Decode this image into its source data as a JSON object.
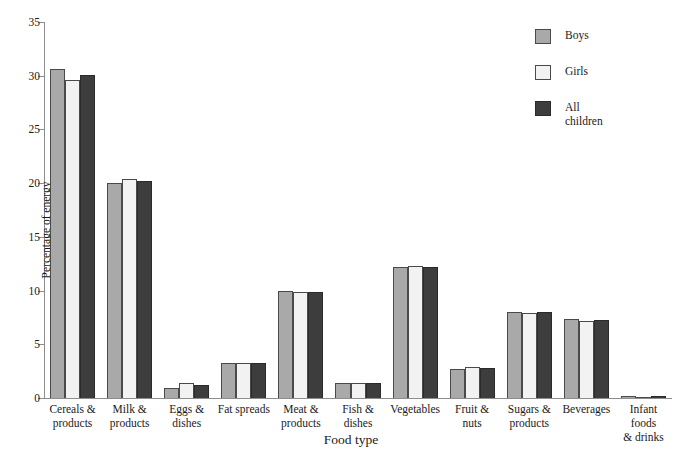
{
  "chart_data": {
    "type": "bar",
    "title": "",
    "xlabel": "Food type",
    "ylabel": "Percentage of energy",
    "ylim": [
      0,
      35
    ],
    "yticks": [
      0,
      5,
      10,
      15,
      20,
      25,
      30,
      35
    ],
    "grid": false,
    "legend_position": "top-right",
    "categories": [
      "Cereals & products",
      "Milk & products",
      "Eggs & dishes",
      "Fat spreads",
      "Meat & products",
      "Fish & dishes",
      "Vegetables",
      "Fruit & nuts",
      "Sugars & products",
      "Beverages",
      "Infant foods & drinks"
    ],
    "category_lines": [
      [
        "Cereals &",
        "products"
      ],
      [
        "Milk &",
        "products"
      ],
      [
        "Eggs &",
        "dishes"
      ],
      [
        "Fat spreads",
        ""
      ],
      [
        "Meat &",
        "products"
      ],
      [
        "Fish &",
        "dishes"
      ],
      [
        "Vegetables",
        ""
      ],
      [
        "Fruit & nuts",
        ""
      ],
      [
        "Sugars &",
        "products"
      ],
      [
        "Beverages",
        ""
      ],
      [
        "Infant foods",
        "& drinks"
      ]
    ],
    "series": [
      {
        "name": "Boys",
        "color": "#a9a9a9",
        "values": [
          30.6,
          20.0,
          0.9,
          3.3,
          10.0,
          1.4,
          12.2,
          2.7,
          8.0,
          7.4,
          0.2
        ]
      },
      {
        "name": "Girls",
        "color": "#f2f2f2",
        "values": [
          29.6,
          20.4,
          1.4,
          3.3,
          9.9,
          1.4,
          12.3,
          2.9,
          7.9,
          7.2,
          0.1
        ]
      },
      {
        "name": "All children",
        "color": "#3d3d3d",
        "values": [
          30.1,
          20.2,
          1.2,
          3.3,
          9.9,
          1.4,
          12.2,
          2.8,
          8.0,
          7.3,
          0.2
        ]
      }
    ]
  },
  "legend": {
    "entries": [
      {
        "label": "Boys"
      },
      {
        "label": "Girls"
      },
      {
        "label": "All\nchildren"
      }
    ]
  }
}
